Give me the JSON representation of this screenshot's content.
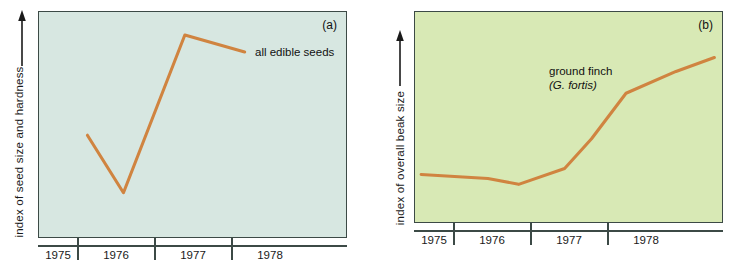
{
  "figure": {
    "panels": [
      {
        "tag": "(a)",
        "ylabel": "index of seed  size and hardness",
        "annotation": "all edible seeds",
        "annotation_italic": "",
        "background_color": "#d7e7e1",
        "line_color": "#d08440"
      },
      {
        "tag": "(b)",
        "ylabel": "index of overall  beak size",
        "annotation": "ground finch",
        "annotation_italic": "(G. fortis)",
        "background_color": "#d8e9b5",
        "line_color": "#d08440"
      }
    ],
    "xticklabels": [
      "1975",
      "1976",
      "1977",
      "1978"
    ]
  },
  "chart_data": [
    {
      "type": "line",
      "title": "(a)",
      "xlabel": "",
      "ylabel": "index of seed  size and hardness",
      "legend": [
        "all edible seeds"
      ],
      "legend_position": "inline-right",
      "grid": false,
      "xlim": [
        1975.0,
        1979.0
      ],
      "ylim": [
        0,
        100
      ],
      "xticklabels": [
        "1975",
        "1976",
        "1977",
        "1978"
      ],
      "xtick_positions": [
        1975.5,
        1976.5,
        1977.5,
        1978.5
      ],
      "series": [
        {
          "name": "all edible seeds",
          "x": [
            1975.63,
            1976.1,
            1976.9,
            1977.68
          ],
          "y": [
            45,
            18,
            92,
            84
          ]
        }
      ]
    },
    {
      "type": "line",
      "title": "(b)",
      "xlabel": "",
      "ylabel": "index of overall  beak size",
      "legend": [
        "ground finch (G. fortis)"
      ],
      "legend_position": "inline-center",
      "grid": false,
      "xlim": [
        1975.0,
        1979.0
      ],
      "ylim": [
        0,
        100
      ],
      "xticklabels": [
        "1975",
        "1976",
        "1977",
        "1978"
      ],
      "xtick_positions": [
        1975.5,
        1976.5,
        1977.5,
        1978.5
      ],
      "series": [
        {
          "name": "ground finch (G. fortis)",
          "x": [
            1975.08,
            1975.95,
            1976.35,
            1976.95,
            1977.3,
            1977.75,
            1978.4,
            1978.9
          ],
          "y": [
            21,
            19,
            16,
            24,
            39,
            62,
            73,
            80
          ]
        }
      ]
    }
  ]
}
